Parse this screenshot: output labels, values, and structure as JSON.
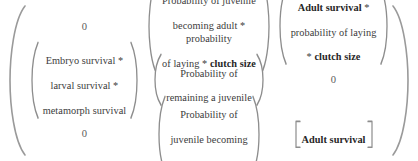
{
  "figure": {
    "name": "population-projection-matrix",
    "outer_bracket": "parenthesis",
    "rows": 3,
    "cols": 3
  },
  "cells": {
    "r1c1": {
      "value": "0",
      "bracket": "none",
      "bold_parts": []
    },
    "r1c2": {
      "bracket": "parenthesis",
      "line1": "Probability of juvenile",
      "line2_plain": "becoming adult * probability",
      "line3_plain": "of laying * ",
      "line3_bold": "clutch size"
    },
    "r1c3": {
      "bracket": "parenthesis",
      "line1_bold": "Adult survival",
      "line1_plain": " *",
      "line2_plain": "probability of laying",
      "line3_plain": "* ",
      "line3_bold": "clutch size"
    },
    "r2c1": {
      "bracket": "parenthesis",
      "line1": "Embryo survival *",
      "line2": "larval survival *",
      "line3": "metamorph survival"
    },
    "r2c2": {
      "bracket": "parenthesis",
      "line1": "Probability of",
      "line2": "remaining a juvenile"
    },
    "r2c3": {
      "value": "0",
      "bracket": "none"
    },
    "r3c1": {
      "value": "0",
      "bracket": "none"
    },
    "r3c2": {
      "bracket": "parenthesis",
      "line1": "Probability of",
      "line2": "juvenile becoming",
      "line3": "adult"
    },
    "r3c3": {
      "bracket": "square",
      "label_bold": "Adult survival"
    }
  },
  "colors": {
    "text": "#3b3b3b",
    "bold_text": "#262626",
    "bracket": "#8d8d8d",
    "outer_bracket": "#9a9a9a",
    "background": "#ffffff"
  }
}
